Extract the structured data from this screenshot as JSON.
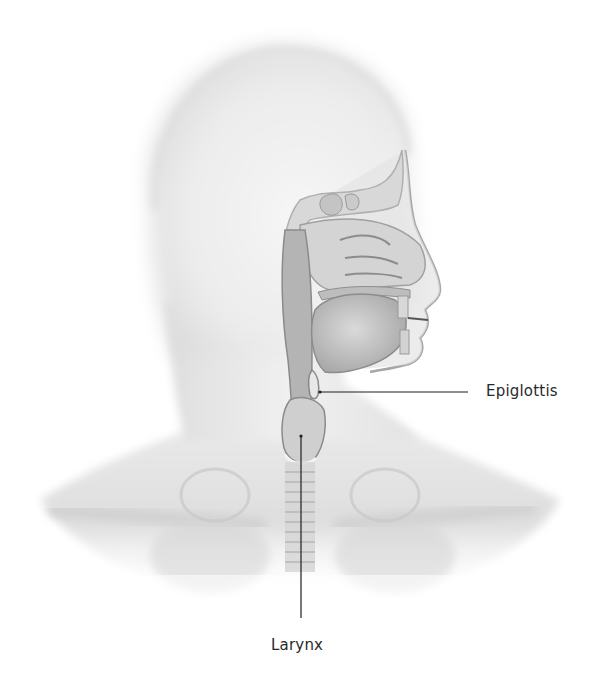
{
  "figure": {
    "background_color": "#ffffff",
    "line_color": "#1e1e1e",
    "labels": [
      {
        "id": "epiglottis",
        "text": "Epiglottis",
        "anchor": [
          320,
          392
        ],
        "line_end": [
          468,
          392
        ]
      },
      {
        "id": "larynx",
        "text": "Larynx",
        "anchor": [
          301,
          436
        ],
        "line_end": [
          301,
          618
        ]
      }
    ]
  }
}
